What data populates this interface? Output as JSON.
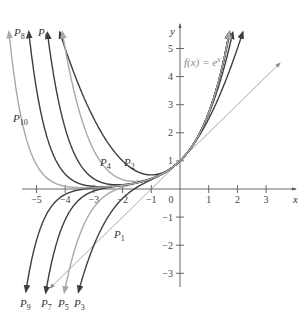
{
  "chart_data": {
    "type": "line",
    "title": "",
    "xlabel": "x",
    "ylabel": "y",
    "xlim": [
      -5.3,
      3.6
    ],
    "ylim": [
      -3.6,
      5.6
    ],
    "x_ticks": [
      -5,
      -4,
      -3,
      -2,
      -1,
      0,
      1,
      2,
      3
    ],
    "y_ticks": [
      -3,
      -2,
      -1,
      1,
      2,
      3,
      4,
      5
    ],
    "grid": false,
    "function_label": "f(x) = e^x",
    "series": [
      {
        "name": "f(x) = e^x",
        "kind": "exp",
        "degree": null,
        "color": "#a8a8a8",
        "width": 1.6
      },
      {
        "name": "P1",
        "kind": "taylor",
        "degree": 1,
        "color": "#8c8c8c",
        "width": 0.9
      },
      {
        "name": "P2",
        "kind": "taylor",
        "degree": 2,
        "color": "#3d3d3d",
        "width": 1.4
      },
      {
        "name": "P3",
        "kind": "taylor",
        "degree": 3,
        "color": "#3d3d3d",
        "width": 1.4
      },
      {
        "name": "P4",
        "kind": "taylor",
        "degree": 4,
        "color": "#a8a8a8",
        "width": 1.4
      },
      {
        "name": "P5",
        "kind": "taylor",
        "degree": 5,
        "color": "#a8a8a8",
        "width": 1.4
      },
      {
        "name": "P6",
        "kind": "taylor",
        "degree": 6,
        "color": "#3d3d3d",
        "width": 1.4
      },
      {
        "name": "P7",
        "kind": "taylor",
        "degree": 7,
        "color": "#3d3d3d",
        "width": 1.4
      },
      {
        "name": "P8",
        "kind": "taylor",
        "degree": 8,
        "color": "#3d3d3d",
        "width": 1.4
      },
      {
        "name": "P9",
        "kind": "taylor",
        "degree": 9,
        "color": "#3d3d3d",
        "width": 1.4
      },
      {
        "name": "P10",
        "kind": "taylor",
        "degree": 10,
        "color": "#a8a8a8",
        "width": 1.4
      }
    ],
    "annotations": [
      {
        "text": "P",
        "sub": "8",
        "x": 14,
        "y": 36
      },
      {
        "text": "P",
        "sub": "6",
        "x": 38,
        "y": 36
      },
      {
        "text": "P",
        "sub": "10",
        "x": 13,
        "y": 122
      },
      {
        "text": "P",
        "sub": "4",
        "x": 100,
        "y": 166
      },
      {
        "text": "P",
        "sub": "2",
        "x": 124,
        "y": 166
      },
      {
        "text": "P",
        "sub": "1",
        "x": 114,
        "y": 238
      },
      {
        "text": "P",
        "sub": "9",
        "x": 20,
        "y": 307
      },
      {
        "text": "P",
        "sub": "7",
        "x": 41,
        "y": 307
      },
      {
        "text": "P",
        "sub": "5",
        "x": 58,
        "y": 307
      },
      {
        "text": "P",
        "sub": "3",
        "x": 74,
        "y": 307
      }
    ]
  }
}
